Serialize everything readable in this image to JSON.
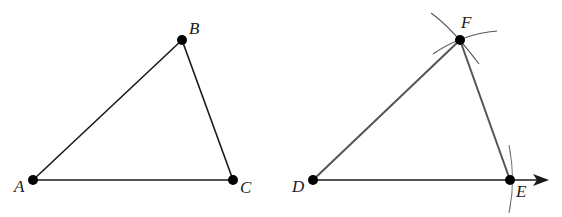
{
  "figures": [
    {
      "name": "triangle-abc",
      "vertices": [
        {
          "label": "A",
          "x": 33,
          "y": 180,
          "lx": 14,
          "ly": 192
        },
        {
          "label": "B",
          "x": 182,
          "y": 40,
          "lx": 189,
          "ly": 34
        },
        {
          "label": "C",
          "x": 233,
          "y": 180,
          "lx": 240,
          "ly": 193
        }
      ]
    },
    {
      "name": "triangle-def-construction",
      "vertices": [
        {
          "label": "D",
          "x": 313,
          "y": 180,
          "lx": 292,
          "ly": 192
        },
        {
          "label": "F",
          "x": 460,
          "y": 40,
          "lx": 461,
          "ly": 28
        },
        {
          "label": "E",
          "x": 510,
          "y": 180,
          "lx": 516,
          "ly": 197
        }
      ],
      "ray_end": {
        "x": 547,
        "y": 180
      }
    }
  ],
  "colors": {
    "line": "#1a1a1a",
    "construction": "#555555"
  }
}
